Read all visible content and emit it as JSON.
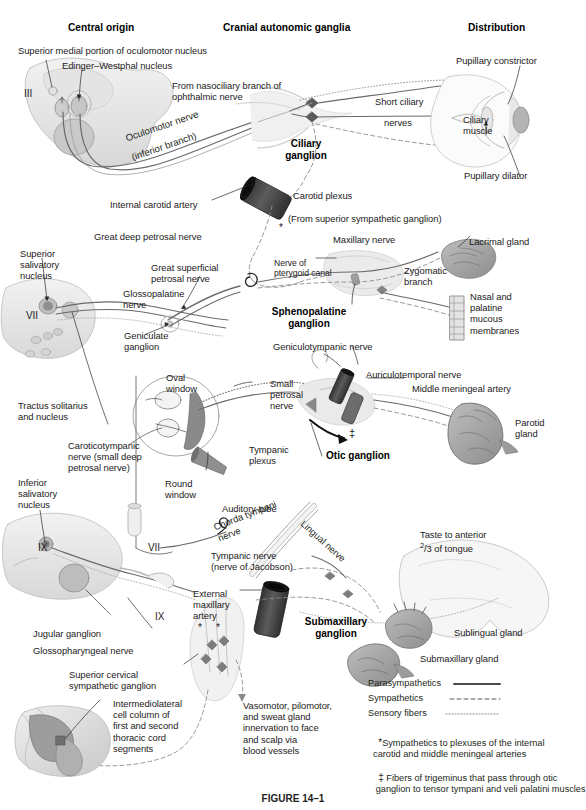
{
  "figure": {
    "caption": "FIGURE 14–1",
    "column_headers": [
      {
        "id": "central-origin",
        "label": "Central origin"
      },
      {
        "id": "cranial-autonomic-ganglia",
        "label": "Cranial autonomic ganglia"
      },
      {
        "id": "distribution",
        "label": "Distribution"
      }
    ]
  },
  "ganglia": [
    {
      "id": "ciliary",
      "label": "Ciliary\nganglion"
    },
    {
      "id": "sphenopalatine",
      "label": "Sphenopalatine\nganglion"
    },
    {
      "id": "otic",
      "label": "Otic ganglion"
    },
    {
      "id": "submaxillary",
      "label": "Submaxillary\nganglion"
    }
  ],
  "labels": {
    "superior_medial_oculomotor": "Superior medial portion of oculomotor nucleus",
    "edinger_westphal": "Edinger–Westphal nucleus",
    "cn3": "III",
    "oculomotor_nerve": "Oculomotor nerve",
    "inferior_branch": "(inferior branch)",
    "from_nasociliary": "From nasociliary branch of\nophthalmic nerve",
    "short_ciliary": "Short ciliary",
    "nerves": "nerves",
    "ciliary_muscle": "Ciliary\nmuscle",
    "pupillary_constrictor": "Pupillary constrictor",
    "pupillary_dilator": "Pupillary dilator",
    "carotid_plexus": "Carotid plexus",
    "internal_carotid_artery": "Internal carotid artery",
    "from_superior_sympathetic": "(From superior sympathetic ganglion)",
    "great_deep_petrosal": "Great deep petrosal nerve",
    "superior_salivatory": "Superior\nsalivatory\nnucleus",
    "cn7_upper": "VII",
    "great_superficial_petrosal": "Great superficial\npetrosal nerve",
    "glossopalatine": "Glossopalatine\nnerve",
    "geniculate_ganglion": "Geniculate\nganglion",
    "nerve_of_pterygoid_canal": "Nerve of\npterygoid canal",
    "maxillary_nerve": "Maxillary nerve",
    "lacrimal_gland": "Lacrimal gland",
    "zygomatic_branch": "Zygomatic\nbranch",
    "nasal_palatine": "Nasal and\npalatine\nmucous\nmembranes",
    "geniculotympanic": "Geniculotympanic nerve",
    "tractus_solitarius": "Tractus solitarius\nand nucleus",
    "caroticotympanic": "Caroticotympanic\nnerve (small deep\npetrosal nerve)",
    "oval_window": "Oval\nwindow",
    "round_window": "Round\nwindow",
    "small_petrosal": "Small\npetrosal\nnerve",
    "tympanic_plexus": "Tympanic\nplexus",
    "auditory_tube": "Auditory tube",
    "auriculotemporal": "Auriculotemporal nerve",
    "middle_meningeal_artery": "Middle meningeal artery",
    "parotid_gland": "Parotid\ngland",
    "inferior_salivatory": "Inferior\nsalivatory\nnucleus",
    "cn9_left": "IX",
    "cn7_lower": "VII",
    "cn9_mid": "IX",
    "cn9_right": "IX",
    "chorda_tympani": "Chorda tympani\nnerve",
    "lingual_nerve": "Lingual nerve",
    "tympanic_nerve": "Tympanic nerve\n(nerve of Jacobson)",
    "taste_anterior": "Taste to anterior",
    "taste_fraction": "/3 of tongue",
    "taste_num": "2",
    "jugular_ganglion": "Jugular ganglion",
    "glossopharyngeal_nerve": "Glossopharyngeal nerve",
    "external_maxillary_artery": "External\nmaxillary\nartery",
    "superior_cervical": "Superior cervical\nsympathetic ganglion",
    "intermediolateral": "Intermediolateral\ncell column of\nfirst and second\nthoracic cord\nsegments",
    "vasomotor": "Vasomotor, pilomotor,\nand sweat gland\ninnervation to face\nand scalp via\nblood vessels",
    "sublingual_gland": "Sublingual gland",
    "submaxillary_gland": "Submaxillary gland"
  },
  "legend": {
    "items": [
      {
        "id": "parasympathetics",
        "label": "Parasympathetics",
        "style": "solid"
      },
      {
        "id": "sympathetics",
        "label": "Sympathetics",
        "style": "dashed"
      },
      {
        "id": "sensory-fibers",
        "label": "Sensory fibers",
        "style": "dotted"
      }
    ],
    "footnotes": [
      {
        "id": "asterisk-note",
        "marker": "*",
        "text": "Sympathetics to plexuses of the internal\n  carotid and middle meningeal arteries"
      },
      {
        "id": "doubledagger-note",
        "marker": "‡",
        "text": " Fibers of trigeminus that pass through otic\n   ganglion to tensor tympani and veli palatini muscles"
      }
    ]
  },
  "markers": {
    "asterisk": "*",
    "double_dagger": "‡"
  },
  "colors": {
    "ink": "#231f20",
    "tissue_light": "#e9e9e9",
    "tissue_mid": "#cfcfcf",
    "tissue_dark": "#9a9a9a",
    "artery_dark": "#3c3c3c",
    "nerve_line": "#5b5b5b"
  }
}
